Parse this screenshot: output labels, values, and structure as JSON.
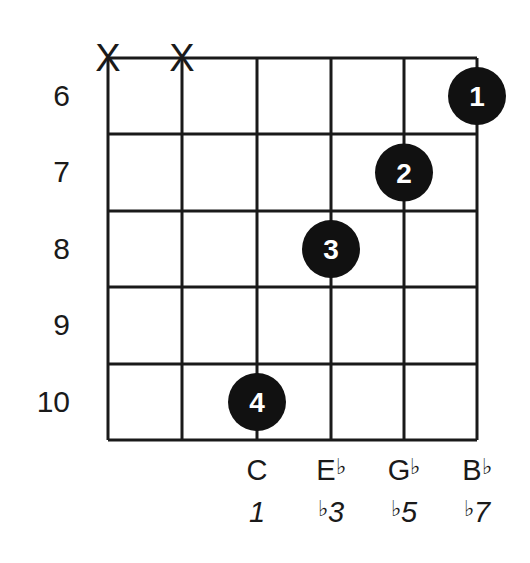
{
  "chord": {
    "strings": 6,
    "frets_shown": 5,
    "fret_numbers": [
      "6",
      "7",
      "8",
      "9",
      "10"
    ],
    "muted_strings": [
      1,
      2
    ],
    "mute_symbol": "X",
    "fingers": [
      {
        "finger": "1",
        "string": 6,
        "fret": "6"
      },
      {
        "finger": "2",
        "string": 5,
        "fret": "7"
      },
      {
        "finger": "3",
        "string": 4,
        "fret": "8"
      },
      {
        "finger": "4",
        "string": 3,
        "fret": "10"
      }
    ],
    "notes": [
      {
        "string": 3,
        "letter": "C",
        "accidental": ""
      },
      {
        "string": 4,
        "letter": "E",
        "accidental": "♭"
      },
      {
        "string": 5,
        "letter": "G",
        "accidental": "♭"
      },
      {
        "string": 6,
        "letter": "B",
        "accidental": "♭"
      }
    ],
    "intervals": [
      {
        "string": 3,
        "accidental": "",
        "degree": "1"
      },
      {
        "string": 4,
        "accidental": "♭",
        "degree": "3"
      },
      {
        "string": 5,
        "accidental": "♭",
        "degree": "5"
      },
      {
        "string": 6,
        "accidental": "♭",
        "degree": "7"
      }
    ],
    "colors": {
      "line": "#1a1a1a",
      "dot": "#111111",
      "dot_text": "#ffffff"
    }
  }
}
